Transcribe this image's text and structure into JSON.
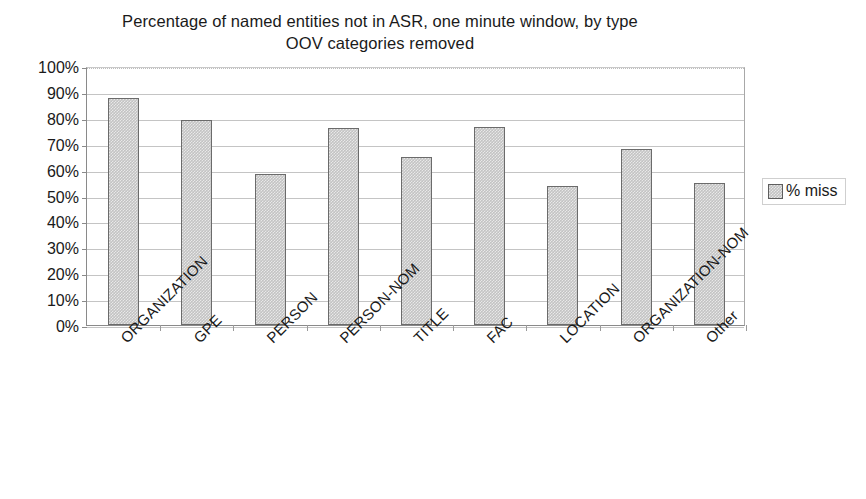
{
  "chart_data": {
    "type": "bar",
    "title": "Percentage of named entities not in ASR, one minute window, by type",
    "subtitle": "OOV categories removed",
    "title_lines": [
      "Percentage of named entities not in ASR, one minute window, by type",
      "OOV categories removed"
    ],
    "xlabel": "",
    "ylabel": "",
    "ylim": [
      0,
      100
    ],
    "ytick_values": [
      0,
      10,
      20,
      30,
      40,
      50,
      60,
      70,
      80,
      90,
      100
    ],
    "ytick_labels": [
      "0%",
      "10%",
      "20%",
      "30%",
      "40%",
      "50%",
      "60%",
      "70%",
      "80%",
      "90%",
      "100%"
    ],
    "grid": true,
    "legend_position": "right",
    "categories": [
      "ORGANIZATION",
      "GPE",
      "PERSON",
      "PERSON-NOM",
      "TITLE",
      "FAC",
      "LOCATION",
      "ORGANIZATION-NOM",
      "Other"
    ],
    "series": [
      {
        "name": "% miss",
        "color": "#c3c3c3",
        "values": [
          87.5,
          79,
          58.5,
          76,
          65,
          76.5,
          53.5,
          68,
          55
        ]
      }
    ]
  },
  "legend": {
    "entries": [
      {
        "label": "% miss",
        "swatch_name": "legend-swatch-percent-miss"
      }
    ]
  },
  "colors": {
    "bar_fill": "#c3c3c3",
    "bar_border": "#6b6b6b",
    "gridline": "#c4c4c4",
    "axis": "#8a8a8a",
    "text": "#1a1a1a",
    "background": "#ffffff"
  }
}
